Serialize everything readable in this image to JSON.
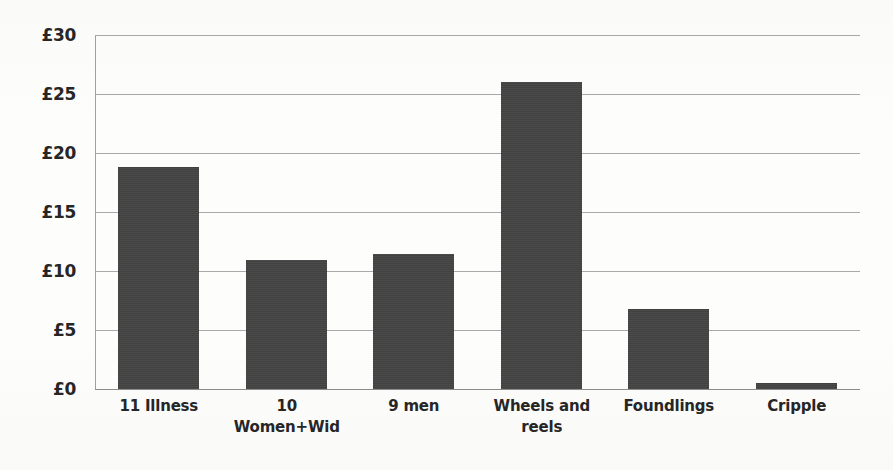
{
  "chart_data": {
    "type": "bar",
    "title": "",
    "subtitle": "",
    "xlabel": "",
    "ylabel": "",
    "categories": [
      "11 Illness",
      "10 Women+Wid",
      "9 men",
      "Wheels and reels",
      "Foundlings",
      "Cripple"
    ],
    "values": [
      18.8,
      10.9,
      11.4,
      26.0,
      6.8,
      0.5
    ],
    "ylim": [
      0,
      30
    ],
    "ytick_labels": [
      "£0",
      "£5",
      "£10",
      "£15",
      "£20",
      "£25",
      "£30"
    ],
    "ytick_values": [
      0,
      5,
      10,
      15,
      20,
      25,
      30
    ],
    "currency_symbol": "£",
    "grid": true,
    "grid_orientation": "horizontal",
    "legend": false,
    "legend_position": "none",
    "bar_color": "#434343",
    "gridline_color": "#a9a9a9",
    "axis_color": "#8c8c8c",
    "background_color": "#fdfdfc",
    "text_color": "#262626",
    "series": [
      {
        "name": "Amount",
        "values": [
          18.8,
          10.9,
          11.4,
          26.0,
          6.8,
          0.5
        ]
      }
    ],
    "bars": [
      {
        "category": "11 Illness",
        "label_lines": [
          "11 Illness"
        ],
        "value": 18.8
      },
      {
        "category": "10 Women+Wid",
        "label_lines": [
          "10 Women+Wid"
        ],
        "value": 10.9
      },
      {
        "category": "9 men",
        "label_lines": [
          "9 men"
        ],
        "value": 11.4
      },
      {
        "category": "Wheels and reels",
        "label_lines": [
          "Wheels and",
          "reels"
        ],
        "value": 26.0
      },
      {
        "category": "Foundlings",
        "label_lines": [
          "Foundlings"
        ],
        "value": 6.8
      },
      {
        "category": "Cripple",
        "label_lines": [
          "Cripple"
        ],
        "value": 0.5
      }
    ]
  }
}
